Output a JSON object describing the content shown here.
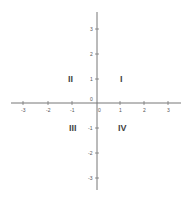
{
  "diagram": {
    "axis_color": "#777777",
    "origin_label": "0",
    "x_ticks": [
      "-3",
      "-2",
      "-1",
      "0",
      "1",
      "2",
      "3"
    ],
    "y_ticks": [
      "3",
      "2",
      "1",
      "-1",
      "-2",
      "-3"
    ],
    "quadrants": {
      "q1": "I",
      "q2": "II",
      "q3": "III",
      "q4": "IV"
    }
  }
}
